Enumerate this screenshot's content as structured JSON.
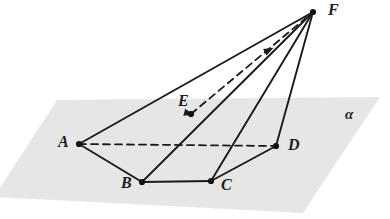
{
  "figure": {
    "background_color": "#ffffff",
    "width": 390,
    "height": 219
  },
  "plane": {
    "name": "alpha",
    "label": "α",
    "label_position": {
      "x": 345,
      "y": 107
    },
    "fill_color": "#e2e2e2",
    "opacity": 0.85,
    "corners": [
      {
        "x": 57,
        "y": 100
      },
      {
        "x": 380,
        "y": 97
      },
      {
        "x": 303,
        "y": 213
      },
      {
        "x": -6,
        "y": 197
      }
    ]
  },
  "style": {
    "stroke_color": "#1a1a1a",
    "solid_width": 1.9,
    "dashed_width": 1.8,
    "dash_pattern": "7 5",
    "vertex_dot_color": "#111111",
    "vertex_dot_radius": 3.1
  },
  "points": [
    {
      "id": "A",
      "label": "A",
      "x": 79,
      "y": 144,
      "label_x": 58,
      "label_y": 134,
      "dot": true
    },
    {
      "id": "B",
      "label": "B",
      "x": 142,
      "y": 182,
      "label_x": 121,
      "label_y": 175,
      "dot": true
    },
    {
      "id": "C",
      "label": "C",
      "x": 211,
      "y": 181,
      "label_x": 221,
      "label_y": 177,
      "dot": true
    },
    {
      "id": "D",
      "label": "D",
      "x": 276,
      "y": 146,
      "label_x": 288,
      "label_y": 137,
      "dot": true
    },
    {
      "id": "E",
      "label": "E",
      "x": 191,
      "y": 114,
      "label_x": 178,
      "label_y": 93,
      "dot": true
    },
    {
      "id": "F",
      "label": "F",
      "x": 313,
      "y": 12,
      "label_x": 328,
      "label_y": 2,
      "dot": true
    }
  ],
  "edges_solid": [
    {
      "id": "AB",
      "from": "A",
      "to": "B"
    },
    {
      "id": "BC",
      "from": "B",
      "to": "C"
    },
    {
      "id": "CD",
      "from": "C",
      "to": "D"
    },
    {
      "id": "AF",
      "from": "A",
      "to": "F"
    },
    {
      "id": "BF",
      "from": "B",
      "to": "F"
    },
    {
      "id": "CF",
      "from": "C",
      "to": "F"
    },
    {
      "id": "DF",
      "from": "D",
      "to": "F"
    }
  ],
  "edges_dashed": [
    {
      "id": "AD",
      "from": "A",
      "to": "D"
    },
    {
      "id": "EF",
      "from": "E",
      "to": "F"
    }
  ],
  "arrow_markers": [
    {
      "id": "arrow-on-AD-at-E",
      "x": 191,
      "y": 114,
      "angle": 15
    },
    {
      "id": "arrow-on-EF",
      "x": 271,
      "y": 49,
      "angle": -27
    }
  ]
}
